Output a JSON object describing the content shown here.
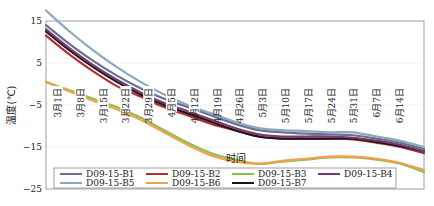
{
  "chart_data": {
    "type": "line",
    "title": "",
    "xlabel": "时间",
    "ylabel": "温度(℃)",
    "ylim": [
      -25,
      15
    ],
    "yticks": [
      15,
      5,
      -5,
      -15,
      -25
    ],
    "grid": true,
    "legend_position": "lower left (inside, 4 columns)",
    "x_tick_labels": [
      "3月1日",
      "3月8日",
      "3月15日",
      "3月22日",
      "3月29日",
      "4月5日",
      "4月12日",
      "4月19日",
      "4月26日",
      "5月3日",
      "5月10日",
      "5月17日",
      "5月24日",
      "5月31日",
      "6月7日",
      "6月14日"
    ],
    "x": [
      "3月1日",
      "3月8日",
      "3月15日",
      "3月22日",
      "3月29日",
      "4月5日",
      "4月12日",
      "4月19日",
      "4月26日",
      "5月3日",
      "5月10日",
      "5月17日",
      "5月24日",
      "5月31日",
      "6月7日",
      "6月14日",
      "6月21日"
    ],
    "series": [
      {
        "name": "D09-15-B1",
        "color": "#6b6f8e",
        "values": [
          14.0,
          9.5,
          5.5,
          2.0,
          -1.0,
          -3.5,
          -5.5,
          -7.5,
          -9.5,
          -11.0,
          -11.5,
          -11.8,
          -12.0,
          -12.2,
          -13.0,
          -14.0,
          -15.5
        ]
      },
      {
        "name": "D09-15-B2",
        "color": "#b03030",
        "values": [
          11.5,
          7.0,
          3.0,
          -0.5,
          -3.0,
          -5.5,
          -7.5,
          -9.5,
          -11.0,
          -12.5,
          -13.0,
          -13.0,
          -13.0,
          -13.2,
          -14.0,
          -15.0,
          -16.5
        ]
      },
      {
        "name": "D09-15-B3",
        "color": "#8cc04a",
        "values": [
          0.5,
          -1.5,
          -3.5,
          -5.5,
          -8.0,
          -11.0,
          -14.0,
          -16.5,
          -18.0,
          -19.0,
          -18.5,
          -18.0,
          -17.5,
          -17.5,
          -18.0,
          -19.0,
          -21.0
        ]
      },
      {
        "name": "D09-15-B4",
        "color": "#7a3a6a",
        "values": [
          13.0,
          8.5,
          4.5,
          1.0,
          -2.0,
          -4.5,
          -6.5,
          -8.5,
          -10.5,
          -12.0,
          -12.5,
          -12.5,
          -12.5,
          -12.8,
          -13.5,
          -14.5,
          -16.0
        ]
      },
      {
        "name": "D09-15-B5",
        "color": "#8aa8c0",
        "values": [
          17.5,
          12.5,
          8.0,
          4.0,
          0.5,
          -2.5,
          -5.0,
          -7.0,
          -9.0,
          -10.5,
          -11.0,
          -11.2,
          -11.5,
          -11.5,
          -12.5,
          -13.5,
          -15.0
        ]
      },
      {
        "name": "D09-15-B6",
        "color": "#f0a050",
        "values": [
          0.5,
          -1.8,
          -4.0,
          -6.0,
          -8.5,
          -11.5,
          -14.5,
          -17.0,
          -18.5,
          -19.0,
          -18.3,
          -17.8,
          -17.3,
          -17.3,
          -17.8,
          -18.8,
          -20.5
        ]
      },
      {
        "name": "D09-15-B7",
        "color": "#1a1420",
        "values": [
          12.5,
          8.0,
          4.0,
          0.5,
          -2.5,
          -5.0,
          -7.0,
          -9.0,
          -11.0,
          -12.5,
          -13.0,
          -13.0,
          -13.0,
          -13.0,
          -13.8,
          -14.8,
          -16.0
        ]
      }
    ]
  }
}
